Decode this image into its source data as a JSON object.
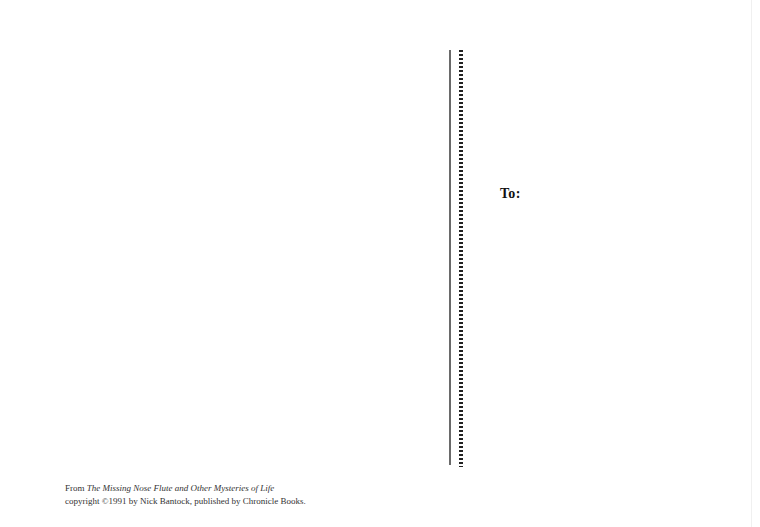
{
  "postcard": {
    "address_label": "To:",
    "credits": {
      "line1_prefix": "From ",
      "line1_title": "The Missing Nose Flute and Other Mysteries of Life",
      "line2": "copyright ©1991 by Nick Bantock, published by Chronicle Books."
    }
  },
  "colors": {
    "background": "#ffffff",
    "divider_solid": "#6a6a6a",
    "divider_dots": "#222222",
    "text": "#333333"
  }
}
